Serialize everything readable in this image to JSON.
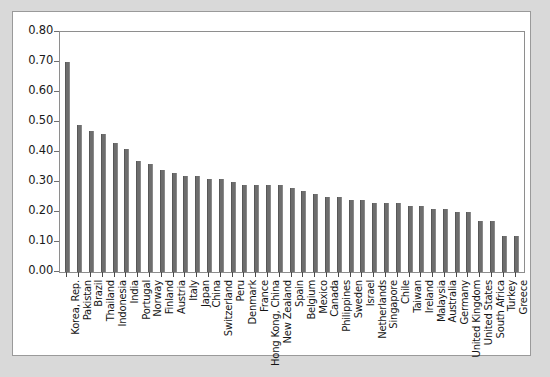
{
  "chart_data": {
    "type": "bar",
    "title": "",
    "subtitle": "",
    "xlabel": "",
    "ylabel": "",
    "ylim": [
      0.0,
      0.8
    ],
    "ytick_labels": [
      "0.80",
      "0.70",
      "0.60",
      "0.50",
      "0.40",
      "0.30",
      "0.20",
      "0.10",
      "0.00"
    ],
    "ytick_values": [
      0.8,
      0.7,
      0.6,
      0.5,
      0.4,
      0.3,
      0.2,
      0.1,
      0.0
    ],
    "grid": false,
    "legend": false,
    "legend_position": "none",
    "bar_color": "#6e6e6e",
    "plot_background": "#ffffff",
    "panel_background": "#ffffff",
    "page_background": "#d9d9d9",
    "categories": [
      "Korea, Rep.",
      "Pakistan",
      "Brazil",
      "Thailand",
      "Indonesia",
      "India",
      "Portugal",
      "Norway",
      "Finland",
      "Austria",
      "Italy",
      "Japan",
      "China",
      "Switzerland",
      "Peru",
      "Denmark",
      "France",
      "Hong Kong, China",
      "New Zealand",
      "Spain",
      "Belgium",
      "Mexico",
      "Canada",
      "Philippines",
      "Sweden",
      "Israel",
      "Netherlands",
      "Singapore",
      "Chile",
      "Taiwan",
      "Ireland",
      "Malaysia",
      "Australia",
      "Germany",
      "United Kingdom",
      "United States",
      "South Africa",
      "Turkey",
      "Greece"
    ],
    "values": [
      0.7,
      0.49,
      0.47,
      0.46,
      0.43,
      0.41,
      0.37,
      0.36,
      0.34,
      0.33,
      0.32,
      0.32,
      0.31,
      0.31,
      0.3,
      0.29,
      0.29,
      0.29,
      0.29,
      0.28,
      0.27,
      0.26,
      0.25,
      0.25,
      0.24,
      0.24,
      0.23,
      0.23,
      0.23,
      0.22,
      0.22,
      0.21,
      0.21,
      0.2,
      0.2,
      0.17,
      0.17,
      0.12,
      0.12
    ]
  }
}
